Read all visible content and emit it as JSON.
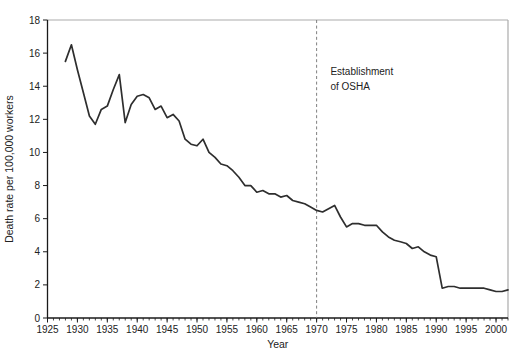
{
  "figure": {
    "background": "#ffffff",
    "width": 519,
    "height": 362
  },
  "chart_data": {
    "type": "line",
    "title": "",
    "xlabel": "Year",
    "ylabel": "Death rate per 100,000 workers",
    "xlim": [
      1925,
      2002
    ],
    "ylim": [
      0,
      18
    ],
    "x_major_ticks": [
      1925,
      1930,
      1935,
      1940,
      1945,
      1950,
      1955,
      1960,
      1965,
      1970,
      1975,
      1980,
      1985,
      1990,
      1995,
      2000
    ],
    "x_minor_tick_interval": 1,
    "y_major_ticks": [
      0,
      2,
      4,
      6,
      8,
      10,
      12,
      14,
      16,
      18
    ],
    "grid": false,
    "legend": null,
    "line_color": "#2e2e2e",
    "axis_color": "#1a1a1a",
    "frame_color": "#ababab",
    "vline": {
      "x_year": 1970,
      "style": "dashed",
      "color": "#7f7f7f"
    },
    "annotation": {
      "lines": [
        "Establishment",
        "of OSHA"
      ],
      "x_year": 1972.3,
      "y_value": 14.65,
      "line_step_value": 0.85,
      "font_px": 10
    },
    "series": [
      {
        "name": "Death rate per 100,000 workers",
        "x": [
          1928,
          1929,
          1930,
          1931,
          1932,
          1933,
          1934,
          1935,
          1936,
          1937,
          1938,
          1939,
          1940,
          1941,
          1942,
          1943,
          1944,
          1945,
          1946,
          1947,
          1948,
          1949,
          1950,
          1951,
          1952,
          1953,
          1954,
          1955,
          1956,
          1957,
          1958,
          1959,
          1960,
          1961,
          1962,
          1963,
          1964,
          1965,
          1966,
          1967,
          1968,
          1969,
          1970,
          1971,
          1972,
          1973,
          1974,
          1975,
          1976,
          1977,
          1978,
          1979,
          1980,
          1981,
          1982,
          1983,
          1984,
          1985,
          1986,
          1987,
          1988,
          1989,
          1990,
          1991,
          1992,
          1993,
          1994,
          1995,
          1996,
          1997,
          1998,
          1999,
          2000,
          2001,
          2002
        ],
        "y": [
          15.5,
          16.5,
          15.0,
          13.6,
          12.2,
          11.7,
          12.6,
          12.8,
          13.8,
          14.7,
          11.8,
          12.9,
          13.4,
          13.5,
          13.3,
          12.6,
          12.8,
          12.1,
          12.3,
          11.9,
          10.8,
          10.5,
          10.4,
          10.8,
          10.0,
          9.7,
          9.3,
          9.2,
          8.9,
          8.5,
          8.0,
          8.0,
          7.6,
          7.7,
          7.5,
          7.5,
          7.3,
          7.4,
          7.1,
          7.0,
          6.9,
          6.7,
          6.5,
          6.4,
          6.6,
          6.8,
          6.1,
          5.5,
          5.7,
          5.7,
          5.6,
          5.6,
          5.6,
          5.2,
          4.9,
          4.7,
          4.6,
          4.5,
          4.2,
          4.3,
          4.0,
          3.8,
          3.7,
          1.8,
          1.9,
          1.9,
          1.8,
          1.8,
          1.8,
          1.8,
          1.8,
          1.7,
          1.6,
          1.6,
          1.7
        ]
      }
    ],
    "plot_area_px": {
      "left": 47.5,
      "right": 508,
      "top": 20,
      "bottom": 318
    },
    "tick_font_px": 10,
    "axis_title_font_px": 10.5
  }
}
